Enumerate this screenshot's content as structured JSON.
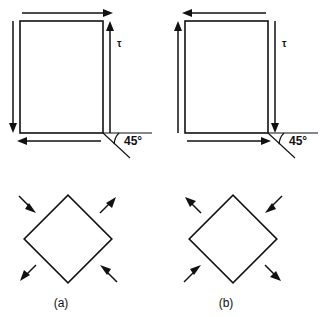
{
  "figure": {
    "background_color": "#ffffff",
    "line_color": "#111111",
    "panels": [
      {
        "id": "a",
        "caption": "(a)",
        "shear_label": "τ",
        "angle_label": "45°",
        "rectangle": {
          "x": 20,
          "y": 21,
          "width": 83,
          "height": 112,
          "hatch_direction": "lower-left-to-upper-right"
        },
        "shear_arrows": [
          {
            "edge": "top",
            "direction": "right"
          },
          {
            "edge": "right",
            "direction": "up"
          },
          {
            "edge": "bottom",
            "direction": "left"
          },
          {
            "edge": "left",
            "direction": "down"
          }
        ],
        "diamond": {
          "center_x": 68,
          "center_y": 239,
          "half_diagonal": 44,
          "hatch_direction": "parallel-to-upper-left-edge"
        },
        "principal_arrows": [
          {
            "position": "top-left",
            "sense": "inward",
            "meaning": "compression"
          },
          {
            "position": "top-right",
            "sense": "outward",
            "meaning": "tension"
          },
          {
            "position": "bottom-left",
            "sense": "outward",
            "meaning": "tension"
          },
          {
            "position": "bottom-right",
            "sense": "inward",
            "meaning": "compression"
          }
        ]
      },
      {
        "id": "b",
        "caption": "(b)",
        "shear_label": "τ",
        "angle_label": "45°",
        "rectangle": {
          "x": 185,
          "y": 21,
          "width": 83,
          "height": 112,
          "hatch_direction": "lower-left-to-upper-right"
        },
        "shear_arrows": [
          {
            "edge": "top",
            "direction": "left"
          },
          {
            "edge": "right",
            "direction": "down"
          },
          {
            "edge": "bottom",
            "direction": "right"
          },
          {
            "edge": "left",
            "direction": "up"
          }
        ],
        "diamond": {
          "center_x": 233,
          "center_y": 239,
          "half_diagonal": 44,
          "hatch_direction": "parallel-to-upper-left-edge"
        },
        "principal_arrows": [
          {
            "position": "top-left",
            "sense": "outward",
            "meaning": "tension"
          },
          {
            "position": "top-right",
            "sense": "inward",
            "meaning": "compression"
          },
          {
            "position": "bottom-left",
            "sense": "inward",
            "meaning": "compression"
          },
          {
            "position": "bottom-right",
            "sense": "outward",
            "meaning": "tension"
          }
        ]
      }
    ]
  }
}
